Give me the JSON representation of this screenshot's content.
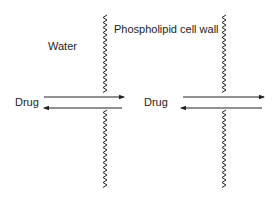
{
  "labels": {
    "water": "Water",
    "membrane": "Phospholipid cell wall",
    "drug_left": "Drug",
    "drug_right": "Drug"
  },
  "colors": {
    "ink": "#222222",
    "background": "#ffffff"
  },
  "diagram": {
    "membranes": [
      {
        "name": "membrane-1",
        "x": 105
      },
      {
        "name": "membrane-2",
        "x": 224
      }
    ],
    "arrows": [
      {
        "name": "drug-in-arrow-1",
        "direction": "right"
      },
      {
        "name": "drug-out-arrow-1",
        "direction": "left"
      },
      {
        "name": "drug-in-arrow-2",
        "direction": "right"
      },
      {
        "name": "drug-out-arrow-2",
        "direction": "left"
      }
    ]
  }
}
